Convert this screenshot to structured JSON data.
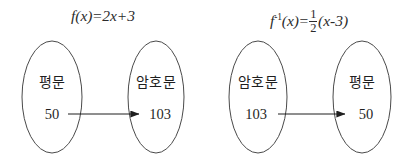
{
  "canvas": {
    "width": 412,
    "height": 166,
    "background": "#ffffff",
    "stroke": "#3a3a3a"
  },
  "diagrams": [
    {
      "name": "encryption-diagram",
      "formula": {
        "function_name": "f",
        "superscript": "",
        "argument": "(x)",
        "equals": "=",
        "expression": "2x+3",
        "full_text": "f(x)=2x+3"
      },
      "source": {
        "label": "평문",
        "value": "50"
      },
      "target": {
        "label": "암호문",
        "value": "103"
      },
      "arrow": {
        "direction": "left-to-right"
      }
    },
    {
      "name": "decryption-diagram",
      "formula": {
        "function_name": "f",
        "superscript": "-1",
        "argument": "(x)",
        "equals": "=",
        "fraction": {
          "numerator": "1",
          "denominator": "2"
        },
        "expression": "(x-3)",
        "full_text": "f^-1(x)=1/2(x-3)"
      },
      "source": {
        "label": "암호문",
        "value": "103"
      },
      "target": {
        "label": "평문",
        "value": "50"
      },
      "arrow": {
        "direction": "left-to-right"
      }
    }
  ]
}
